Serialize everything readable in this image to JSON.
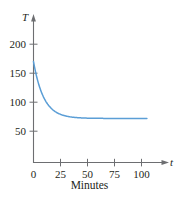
{
  "chart_data": {
    "type": "line",
    "title": "",
    "subtitle": "",
    "xlabel": "Minutes",
    "ylabel": "",
    "x_axis_symbol": "t",
    "y_axis_symbol": "T",
    "xlim": [
      0,
      108
    ],
    "ylim": [
      0,
      215
    ],
    "xticks": [
      0,
      25,
      50,
      75,
      100
    ],
    "yticks": [
      50,
      100,
      150,
      200
    ],
    "xtick_labels": [
      "0",
      "25",
      "50",
      "75",
      "100"
    ],
    "ytick_labels": [
      "50",
      "100",
      "150",
      "200"
    ],
    "grid": false,
    "legend": false,
    "legend_position": "none",
    "annotations": [],
    "series": [
      {
        "name": "Temperature",
        "color": "#5b9ed6",
        "asymptote": 72,
        "initial_value": 170,
        "x": [
          0,
          2,
          4,
          6,
          8,
          10,
          12,
          15,
          18,
          21,
          25,
          30,
          35,
          40,
          45,
          50,
          60,
          70,
          80,
          90,
          100,
          105
        ],
        "values": [
          170,
          152,
          137,
          124,
          113,
          104,
          97,
          89,
          83,
          80,
          77,
          74,
          73,
          72.5,
          72.2,
          72.1,
          72,
          72,
          72,
          72,
          72,
          72
        ]
      }
    ]
  },
  "axis": {
    "t_symbol": "t",
    "T_symbol": "T",
    "caption": "Minutes",
    "axis_color": "#6d6e71",
    "text_color": "#231f20",
    "curve_color": "#5b9ed6"
  }
}
